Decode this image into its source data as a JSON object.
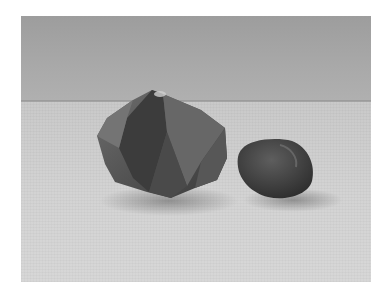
{
  "image": {
    "description": "Black-and-white photograph of two stones on a textured cloth surface against a plain backdrop",
    "subjects": [
      {
        "name": "faceted crystal",
        "position": "left-center"
      },
      {
        "name": "rounded pebble",
        "position": "right-center"
      }
    ],
    "colors": {
      "backdrop": "#a6a6a6",
      "surface": "#d0d0d0",
      "stone_dark": "#3a3a3a",
      "page": "#ffffff"
    }
  }
}
